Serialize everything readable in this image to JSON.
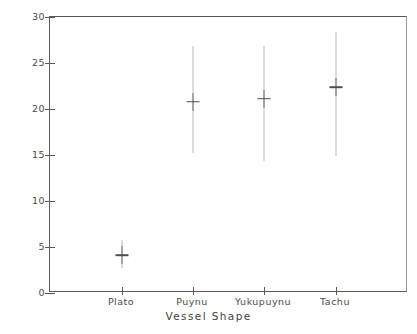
{
  "chart_data": {
    "type": "scatter",
    "title": "",
    "xlabel": "Vessel Shape",
    "ylabel": "Height of Vessel (in cm)",
    "categories": [
      "Plato",
      "Puynu",
      "Yukupuynu",
      "Tachu"
    ],
    "values": [
      4.1,
      20.8,
      21.1,
      22.4
    ],
    "ranges_low": [
      2.7,
      15.2,
      14.4,
      14.9
    ],
    "ranges_high": [
      5.8,
      26.9,
      26.9,
      28.4
    ],
    "ylim": [
      0,
      30
    ],
    "yticks": [
      0,
      5,
      10,
      15,
      20,
      25,
      30
    ],
    "ytick_labels": [
      "0",
      "5",
      "10",
      "15",
      "20",
      "25",
      "30"
    ],
    "grid": false,
    "legend": "none",
    "series": [
      {
        "name": "Height of Vessel (in cm)",
        "points": [
          {
            "category": "Plato",
            "mean": 4.1,
            "low": 2.7,
            "high": 5.8
          },
          {
            "category": "Puynu",
            "mean": 20.8,
            "low": 15.2,
            "high": 26.9
          },
          {
            "category": "Yukupuynu",
            "mean": 21.1,
            "low": 14.4,
            "high": 26.9
          },
          {
            "category": "Tachu",
            "mean": 22.4,
            "low": 14.9,
            "high": 28.4
          }
        ]
      }
    ]
  },
  "axes": {
    "y_title": "Height of Vessel (in cm)",
    "x_title": "Vessel Shape",
    "y_tick_labels": [
      "0",
      "5",
      "10",
      "15",
      "20",
      "25",
      "30"
    ],
    "x_tick_labels": [
      "Plato",
      "Puynu",
      "Yukupuynu",
      "Tachu"
    ]
  },
  "caption": {
    "text": ""
  },
  "colors": {
    "axis": "#5a5a5a",
    "range_line": "#b9b9b9",
    "marker": "#4f4f4f",
    "background": "#ffffff"
  }
}
